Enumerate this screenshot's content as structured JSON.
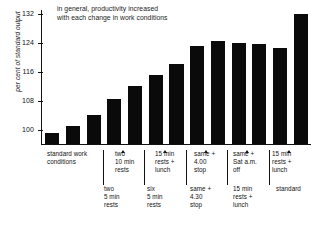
{
  "chart_data": {
    "type": "bar",
    "title": "in general, productivity increased with each change in work conditions",
    "title_line1": "in general, productivity increased",
    "title_line2": "with each change in work conditions",
    "xlabel": "",
    "ylabel": "per cent of standard output",
    "ylim": [
      96,
      133
    ],
    "yticks": [
      100,
      108,
      116,
      124,
      132
    ],
    "ytick_labels": [
      "100",
      "108",
      "116",
      "124",
      "132"
    ],
    "grid": false,
    "legend": false,
    "bar_color": "#0a0a0a",
    "categories": [
      "standard work conditions",
      "standard work conditions",
      "standard work conditions",
      "two 5 min rests",
      "two 10 min rests",
      "six 5 min rests",
      "15 min rests + lunch",
      "same + 4.30 stop",
      "same + 4.00 stop",
      "15 min rests + lunch",
      "same + Sat a.m. off",
      "standard",
      "15 min rests + lunch"
    ],
    "values": [
      99,
      101,
      104,
      108.5,
      112,
      115,
      118,
      123,
      124.5,
      124,
      123.5,
      122.5,
      132
    ],
    "annotations": [
      {
        "label": "standard work conditions",
        "row": 1,
        "bar_index": 1
      },
      {
        "label": "two 10 min rests",
        "row": 1,
        "bar_index": 4
      },
      {
        "label": "15 min rests + lunch",
        "row": 1,
        "bar_index": 6
      },
      {
        "label": "same + 4.00 stop",
        "row": 1,
        "bar_index": 8
      },
      {
        "label": "same + Sat a.m. off",
        "row": 1,
        "bar_index": 10
      },
      {
        "label": "15 min rests + lunch",
        "row": 1,
        "bar_index": 12
      },
      {
        "label": "two 5 min rests",
        "row": 2,
        "bar_index": 3
      },
      {
        "label": "six 5 min rests",
        "row": 2,
        "bar_index": 5
      },
      {
        "label": "same + 4.30 stop",
        "row": 2,
        "bar_index": 7
      },
      {
        "label": "15 min rests + lunch",
        "row": 2,
        "bar_index": 9
      },
      {
        "label": "standard",
        "row": 2,
        "bar_index": 11
      }
    ]
  },
  "xlabels_row1": [
    {
      "line1": "standard work",
      "line2": "conditions",
      "line3": ""
    },
    {
      "line1": "two",
      "line2": "10 min",
      "line3": "rests"
    },
    {
      "line1": "15 min",
      "line2": "rests +",
      "line3": "lunch"
    },
    {
      "line1": "same +",
      "line2": "4.00",
      "line3": "stop"
    },
    {
      "line1": "same +",
      "line2": "Sat a.m.",
      "line3": "off"
    },
    {
      "line1": "15 min",
      "line2": "rests +",
      "line3": "lunch"
    }
  ],
  "xlabels_row2": [
    {
      "line1": "two",
      "line2": "5 min",
      "line3": "rests"
    },
    {
      "line1": "six",
      "line2": "5 min",
      "line3": "rests"
    },
    {
      "line1": "same +",
      "line2": "4.30",
      "line3": "stop"
    },
    {
      "line1": "15 min",
      "line2": "rests +",
      "line3": "lunch"
    },
    {
      "line1": "standard",
      "line2": "",
      "line3": ""
    }
  ],
  "yticks": [
    {
      "label": "132"
    },
    {
      "label": "124"
    },
    {
      "label": "116"
    },
    {
      "label": "108"
    },
    {
      "label": "100"
    }
  ]
}
